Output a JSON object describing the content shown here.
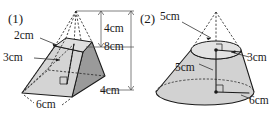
{
  "page": {
    "background": "#ffffff",
    "ink": "#1a1a1a",
    "width": 271,
    "height": 124
  },
  "figures": [
    {
      "index_label": "(1)",
      "shape": "square-frustum-with-apex-extension",
      "unit": "cm",
      "labels": {
        "top_edge": "2cm",
        "slant_or_lateral": "3cm",
        "upper_height": "4cm",
        "total_height": "8cm",
        "base_depth": "4cm",
        "base_width": "6cm"
      },
      "dimensions": [
        {
          "name": "top-edge",
          "value": 2,
          "unit": "cm",
          "text": "2cm"
        },
        {
          "name": "left-slant",
          "value": 3,
          "unit": "cm",
          "text": "3cm"
        },
        {
          "name": "apex-height",
          "value": 4,
          "unit": "cm",
          "text": "4cm"
        },
        {
          "name": "full-height",
          "value": 8,
          "unit": "cm",
          "text": "8cm"
        },
        {
          "name": "base-side-right",
          "value": 4,
          "unit": "cm",
          "text": "4cm"
        },
        {
          "name": "base-side-front",
          "value": 6,
          "unit": "cm",
          "text": "6cm"
        }
      ]
    },
    {
      "index_label": "(2)",
      "shape": "cone-frustum-with-apex-extension",
      "unit": "cm",
      "labels": {
        "upper_cone_height": "5cm",
        "top_radius": "3cm",
        "frustum_height": "5cm",
        "base_radius": "6cm"
      },
      "dimensions": [
        {
          "name": "apex-height",
          "value": 5,
          "unit": "cm",
          "text": "5cm"
        },
        {
          "name": "top-radius",
          "value": 3,
          "unit": "cm",
          "text": "3cm"
        },
        {
          "name": "frustum-height",
          "value": 5,
          "unit": "cm",
          "text": "5cm"
        },
        {
          "name": "base-radius",
          "value": 6,
          "unit": "cm",
          "text": "6cm"
        }
      ]
    }
  ]
}
